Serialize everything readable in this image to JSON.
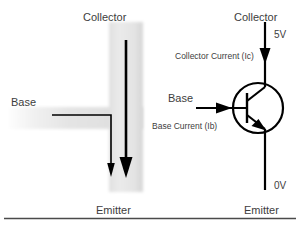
{
  "figure": {
    "width": 300,
    "height": 228,
    "background": "#ffffff",
    "rule_color": "#4a4a4a"
  },
  "pictorial": {
    "collector_label": "Collector",
    "base_label": "Base",
    "emitter_label": "Emitter",
    "body_fill_light": "#e8e8e8",
    "body_fill_mid": "#d9d9d9",
    "arrow_color": "#000000",
    "thin_arrow_meaning": "base-current-path",
    "thick_arrow_meaning": "collector-current-path"
  },
  "schematic": {
    "collector_label": "Collector",
    "collector_voltage": "5V",
    "collector_current_label": "Collector Current (Ic)",
    "base_label": "Base",
    "base_current_label": "Base Current (Ib)",
    "emitter_voltage": "0V",
    "emitter_label": "Emitter",
    "symbol": "npn-bipolar-junction-transistor",
    "line_color": "#000000"
  }
}
